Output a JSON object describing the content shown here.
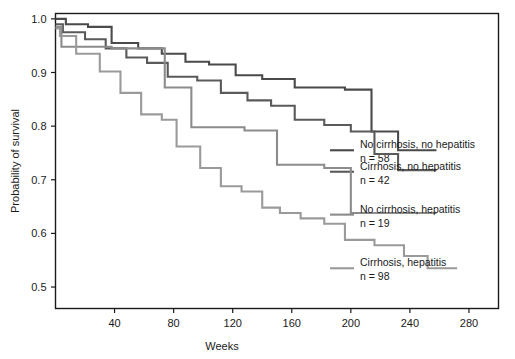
{
  "chart_data": {
    "type": "line",
    "subtype": "kaplan-meier-step",
    "title": "",
    "xlabel": "Weeks",
    "ylabel": "Probability of survival",
    "xlim": [
      0,
      300
    ],
    "ylim": [
      0.46,
      1.01
    ],
    "xticks": [
      40,
      80,
      120,
      160,
      200,
      240,
      280
    ],
    "xtick_labels": [
      "40",
      "80",
      "120",
      "160",
      "200",
      "240",
      "280"
    ],
    "yticks": [
      0.5,
      0.6,
      0.7,
      0.8,
      0.9,
      1.0
    ],
    "ytick_labels": [
      "0.5",
      "0.6",
      "0.7",
      "0.8",
      "0.9",
      "1.0"
    ],
    "grid": false,
    "legend_position": "right-inside",
    "series": [
      {
        "name": "No cirrhosis, no hepatitis",
        "n_label": "n = 58",
        "n": 58,
        "color": "#4a4a4a",
        "legend_y": 0.755,
        "points": [
          [
            0,
            1.0
          ],
          [
            7,
            1.0
          ],
          [
            7,
            0.99
          ],
          [
            22,
            0.99
          ],
          [
            22,
            0.985
          ],
          [
            38,
            0.985
          ],
          [
            38,
            0.955
          ],
          [
            56,
            0.955
          ],
          [
            56,
            0.945
          ],
          [
            72,
            0.945
          ],
          [
            72,
            0.935
          ],
          [
            88,
            0.935
          ],
          [
            88,
            0.92
          ],
          [
            104,
            0.92
          ],
          [
            104,
            0.915
          ],
          [
            122,
            0.915
          ],
          [
            122,
            0.895
          ],
          [
            140,
            0.895
          ],
          [
            140,
            0.888
          ],
          [
            162,
            0.888
          ],
          [
            162,
            0.872
          ],
          [
            196,
            0.872
          ],
          [
            196,
            0.868
          ],
          [
            214,
            0.868
          ],
          [
            214,
            0.79
          ],
          [
            232,
            0.79
          ],
          [
            232,
            0.755
          ],
          [
            258,
            0.755
          ]
        ]
      },
      {
        "name": "Cirrhosis, no hepatitis",
        "n_label": "n = 42",
        "n": 42,
        "color": "#5a5a5a",
        "legend_y": 0.715,
        "points": [
          [
            0,
            0.99
          ],
          [
            5,
            0.99
          ],
          [
            5,
            0.975
          ],
          [
            20,
            0.975
          ],
          [
            20,
            0.962
          ],
          [
            34,
            0.962
          ],
          [
            34,
            0.945
          ],
          [
            48,
            0.945
          ],
          [
            48,
            0.928
          ],
          [
            62,
            0.928
          ],
          [
            62,
            0.918
          ],
          [
            76,
            0.918
          ],
          [
            76,
            0.892
          ],
          [
            96,
            0.892
          ],
          [
            96,
            0.885
          ],
          [
            112,
            0.885
          ],
          [
            112,
            0.862
          ],
          [
            130,
            0.862
          ],
          [
            130,
            0.848
          ],
          [
            146,
            0.848
          ],
          [
            146,
            0.838
          ],
          [
            162,
            0.838
          ],
          [
            162,
            0.812
          ],
          [
            182,
            0.812
          ],
          [
            182,
            0.802
          ],
          [
            200,
            0.802
          ],
          [
            200,
            0.79
          ],
          [
            216,
            0.79
          ],
          [
            216,
            0.748
          ],
          [
            232,
            0.748
          ],
          [
            232,
            0.718
          ],
          [
            258,
            0.718
          ]
        ]
      },
      {
        "name": "No cirrhosis, hepatitis",
        "n_label": "n = 19",
        "n": 19,
        "color": "#8c8c8c",
        "legend_y": 0.635,
        "points": [
          [
            0,
            0.985
          ],
          [
            4,
            0.985
          ],
          [
            4,
            0.948
          ],
          [
            38,
            0.948
          ],
          [
            38,
            0.945
          ],
          [
            74,
            0.945
          ],
          [
            74,
            0.872
          ],
          [
            92,
            0.872
          ],
          [
            92,
            0.798
          ],
          [
            128,
            0.798
          ],
          [
            128,
            0.792
          ],
          [
            150,
            0.792
          ],
          [
            150,
            0.728
          ],
          [
            182,
            0.728
          ],
          [
            182,
            0.722
          ],
          [
            200,
            0.722
          ],
          [
            200,
            0.638
          ],
          [
            258,
            0.638
          ]
        ]
      },
      {
        "name": "Cirrhosis, hepatitis",
        "n_label": "n = 98",
        "n": 98,
        "color": "#9a9a9a",
        "legend_y": 0.535,
        "points": [
          [
            0,
            0.982
          ],
          [
            3,
            0.982
          ],
          [
            3,
            0.968
          ],
          [
            14,
            0.968
          ],
          [
            14,
            0.935
          ],
          [
            30,
            0.935
          ],
          [
            30,
            0.902
          ],
          [
            44,
            0.902
          ],
          [
            44,
            0.862
          ],
          [
            58,
            0.862
          ],
          [
            58,
            0.822
          ],
          [
            72,
            0.822
          ],
          [
            72,
            0.812
          ],
          [
            82,
            0.812
          ],
          [
            82,
            0.762
          ],
          [
            98,
            0.762
          ],
          [
            98,
            0.722
          ],
          [
            112,
            0.722
          ],
          [
            112,
            0.688
          ],
          [
            126,
            0.688
          ],
          [
            126,
            0.678
          ],
          [
            140,
            0.678
          ],
          [
            140,
            0.648
          ],
          [
            152,
            0.648
          ],
          [
            152,
            0.638
          ],
          [
            166,
            0.638
          ],
          [
            166,
            0.628
          ],
          [
            182,
            0.628
          ],
          [
            182,
            0.618
          ],
          [
            196,
            0.618
          ],
          [
            196,
            0.588
          ],
          [
            216,
            0.588
          ],
          [
            216,
            0.578
          ],
          [
            236,
            0.578
          ],
          [
            236,
            0.558
          ],
          [
            252,
            0.558
          ],
          [
            252,
            0.535
          ],
          [
            272,
            0.535
          ]
        ]
      }
    ]
  }
}
